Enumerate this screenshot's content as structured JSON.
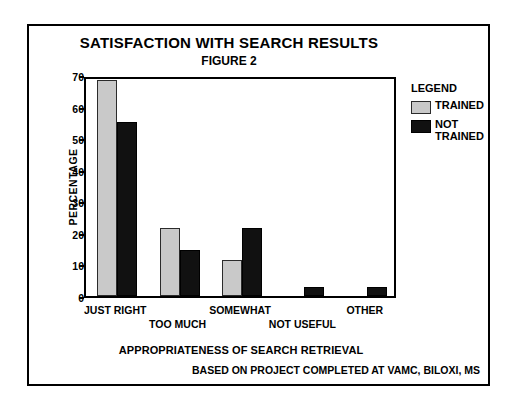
{
  "chart_data": {
    "type": "bar",
    "title": "SATISFACTION WITH SEARCH RESULTS",
    "subtitle": "FIGURE 2",
    "xlabel": "APPROPRIATENESS OF SEARCH RETRIEVAL",
    "ylabel": "PERCENTAGE",
    "ylim": [
      0,
      70
    ],
    "yticks": [
      0,
      10,
      20,
      30,
      40,
      50,
      60,
      70
    ],
    "ytick_labels": [
      "0",
      "10",
      "20",
      "30",
      "40",
      "50",
      "60",
      "70"
    ],
    "grid": false,
    "legend_position": "right",
    "categories": [
      "JUST RIGHT",
      "TOO MUCH",
      "SOMEWHAT",
      "NOT USEFUL",
      "OTHER"
    ],
    "series": [
      {
        "name": "TRAINED",
        "color": "#c9c9c9",
        "values": [
          68.5,
          21.5,
          11.5,
          0,
          0
        ]
      },
      {
        "name": "NOT TRAINED",
        "color": "#111111",
        "values": [
          55,
          14.5,
          21.5,
          3,
          3
        ]
      }
    ],
    "footnote": "BASED ON PROJECT COMPLETED AT VAMC, BILOXI, MS"
  },
  "legend": {
    "title": "LEGEND",
    "entries": [
      {
        "label": "TRAINED"
      },
      {
        "label": "NOT\nTRAINED"
      }
    ]
  }
}
